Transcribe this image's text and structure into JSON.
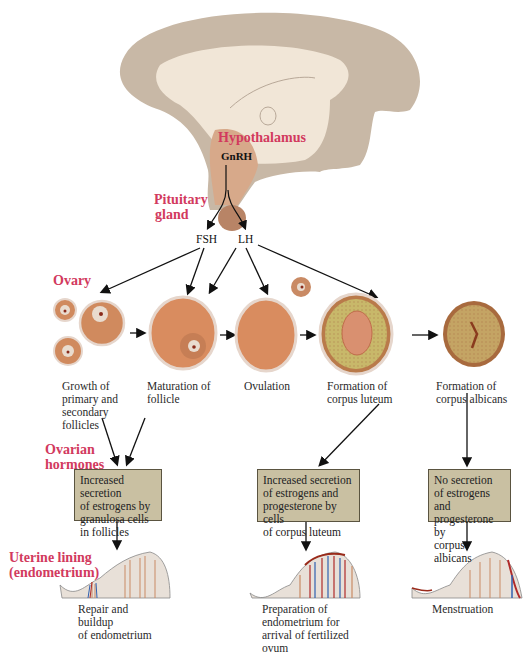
{
  "brain": {
    "hypothalamus_label": "Hypothalamus",
    "gnrh_label": "GnRH",
    "pituitary_label_1": "Pituitary",
    "pituitary_label_2": "gland"
  },
  "hormones": {
    "fsh": "FSH",
    "lh": "LH"
  },
  "ovary": {
    "label": "Ovary",
    "stages": [
      {
        "line1": "Growth of",
        "line2": "primary and",
        "line3": "secondary",
        "line4": "follicles"
      },
      {
        "line1": "Maturation of",
        "line2": "follicle"
      },
      {
        "line1": "Ovulation"
      },
      {
        "line1": "Formation of",
        "line2": "corpus luteum"
      },
      {
        "line1": "Formation of",
        "line2": "corpus albicans"
      }
    ]
  },
  "ovarian_hormones": {
    "label_1": "Ovarian",
    "label_2": "hormones",
    "boxes": [
      {
        "line1": "Increased secretion",
        "line2": "of estrogens by",
        "line3": "granulosa cells",
        "line4": "in follicles"
      },
      {
        "line1": "Increased secretion",
        "line2": "of estrogens and",
        "line3": "progesterone by cells",
        "line4": "of corpus luteum"
      },
      {
        "line1": "No secretion",
        "line2": "of estrogens and",
        "line3": "progesterone by",
        "line4": "corpus albicans"
      }
    ]
  },
  "uterine": {
    "label_1": "Uterine lining",
    "label_2": "(endometrium)",
    "stages": [
      {
        "line1": "Repair and",
        "line2": "buildup",
        "line3": "of endometrium"
      },
      {
        "line1": "Preparation of",
        "line2": "endometrium for",
        "line3": "arrival of fertilized",
        "line4": "ovum"
      },
      {
        "line1": "Menstruation"
      }
    ]
  },
  "colors": {
    "label_pink": "#d23a5e",
    "box_fill": "#c9c0a2",
    "follicle": "#d98c5f",
    "brain": "#c8b8a6"
  }
}
